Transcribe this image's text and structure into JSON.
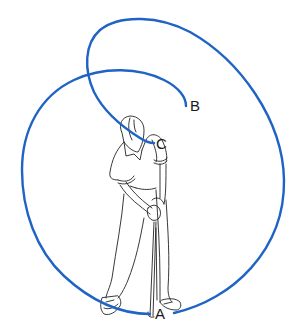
{
  "diagram": {
    "path_color": "#1f63c4",
    "line_color": "#222222",
    "labels": [
      {
        "id": "A",
        "text": "A",
        "x": 157,
        "y": 305
      },
      {
        "id": "B",
        "text": "B",
        "x": 189,
        "y": 94
      },
      {
        "id": "C",
        "text": "C",
        "x": 156,
        "y": 134
      }
    ]
  }
}
